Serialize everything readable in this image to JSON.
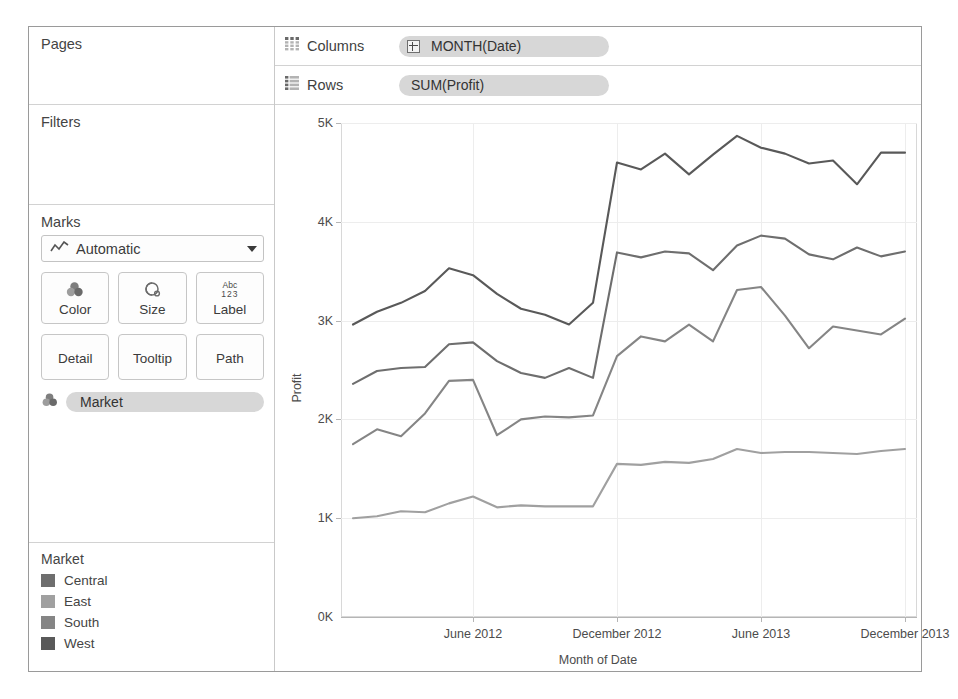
{
  "sidebar": {
    "pages": {
      "title": "Pages"
    },
    "filters": {
      "title": "Filters"
    },
    "marks": {
      "title": "Marks",
      "mark_type": "Automatic",
      "mark_type_icon": "line-chart-icon",
      "buttons": [
        {
          "label": "Color",
          "icon": "color-palette-icon"
        },
        {
          "label": "Size",
          "icon": "size-circle-icon"
        },
        {
          "label": "Label",
          "icon": "abc-123-icon",
          "icon_text_top": "Abc",
          "icon_text_bottom": "123"
        },
        {
          "label": "Detail",
          "icon": "detail-icon"
        },
        {
          "label": "Tooltip",
          "icon": "tooltip-icon"
        },
        {
          "label": "Path",
          "icon": "path-icon"
        }
      ],
      "encoding_pills": [
        {
          "label": "Market",
          "icon": "color-palette-icon"
        }
      ]
    },
    "legend": {
      "title": "Market",
      "items": [
        {
          "label": "Central",
          "color": "#6e6e6e"
        },
        {
          "label": "East",
          "color": "#a0a0a0"
        },
        {
          "label": "South",
          "color": "#858585"
        },
        {
          "label": "West",
          "color": "#595959"
        }
      ]
    }
  },
  "shelves": [
    {
      "name": "Columns",
      "icon": "columns-grid-icon",
      "pill": {
        "label": "MONTH(Date)",
        "expandable": true,
        "expand_icon": "plus-box-icon"
      }
    },
    {
      "name": "Rows",
      "icon": "rows-grid-icon",
      "pill": {
        "label": "SUM(Profit)",
        "expandable": false
      }
    }
  ],
  "chart_data": {
    "type": "line",
    "title": "",
    "xlabel": "Month of Date",
    "ylabel": "Profit",
    "ylim": [
      0,
      5000
    ],
    "yticks": [
      0,
      1000,
      2000,
      3000,
      4000,
      5000
    ],
    "ytick_labels": [
      "0K",
      "1K",
      "2K",
      "3K",
      "4K",
      "5K"
    ],
    "grid": true,
    "legend_position": "external-left-bottom",
    "x": [
      "2012-01",
      "2012-02",
      "2012-03",
      "2012-04",
      "2012-05",
      "2012-06",
      "2012-07",
      "2012-08",
      "2012-09",
      "2012-10",
      "2012-11",
      "2012-12",
      "2013-01",
      "2013-02",
      "2013-03",
      "2013-04",
      "2013-05",
      "2013-06",
      "2013-07",
      "2013-08",
      "2013-09",
      "2013-10",
      "2013-11",
      "2013-12"
    ],
    "xtick_labels": [
      "June 2012",
      "December 2012",
      "June 2013",
      "December 2013"
    ],
    "xtick_indices": [
      5,
      11,
      17,
      23
    ],
    "series": [
      {
        "name": "West",
        "color": "#595959",
        "values": [
          2960,
          3090,
          3180,
          3300,
          3530,
          3460,
          3270,
          3120,
          3060,
          2960,
          3180,
          4600,
          4530,
          4690,
          4480,
          4680,
          4870,
          4750,
          4690,
          4590,
          4620,
          4380,
          4700,
          4700
        ]
      },
      {
        "name": "Central",
        "color": "#6e6e6e",
        "values": [
          2360,
          2490,
          2520,
          2530,
          2760,
          2780,
          2590,
          2470,
          2420,
          2520,
          2420,
          3690,
          3640,
          3700,
          3680,
          3510,
          3760,
          3860,
          3830,
          3670,
          3620,
          3740,
          3650,
          3700
        ]
      },
      {
        "name": "South",
        "color": "#858585",
        "values": [
          1750,
          1900,
          1830,
          2060,
          2390,
          2400,
          1840,
          2000,
          2030,
          2020,
          2040,
          2640,
          2840,
          2790,
          2960,
          2790,
          3310,
          3340,
          3050,
          2720,
          2940,
          2900,
          2860,
          3020
        ]
      },
      {
        "name": "East",
        "color": "#a0a0a0",
        "values": [
          1000,
          1020,
          1070,
          1060,
          1150,
          1220,
          1110,
          1130,
          1120,
          1120,
          1120,
          1550,
          1540,
          1570,
          1560,
          1600,
          1700,
          1660,
          1670,
          1670,
          1660,
          1650,
          1680,
          1700
        ]
      }
    ]
  }
}
